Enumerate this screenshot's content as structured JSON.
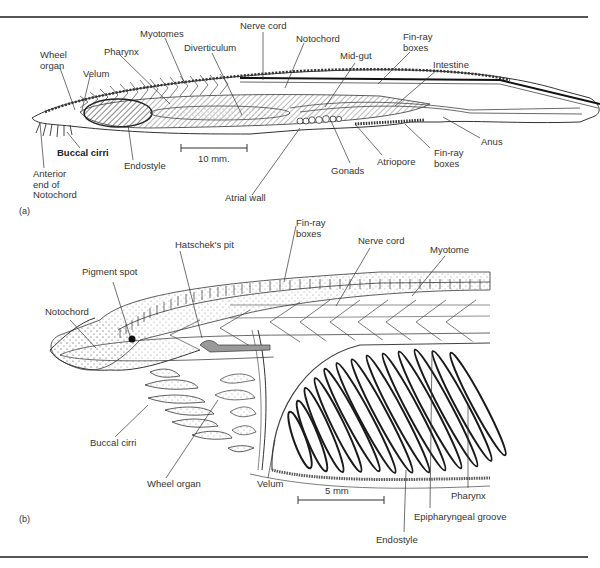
{
  "figure_a": {
    "panel_label": "(a)",
    "scale_bar": "10 mm.",
    "labels": {
      "wheel_organ": "Wheel\norgan",
      "velum": "Velum",
      "pharynx": "Pharynx",
      "myotomes": "Myotomes",
      "diverticulum": "Diverticulum",
      "nerve_cord": "Nerve cord",
      "notochord": "Notochord",
      "mid_gut": "Mid-gut",
      "fin_ray_boxes_top": "Fin-ray\nboxes",
      "intestine": "Intestine",
      "anus": "Anus",
      "fin_ray_boxes_bottom": "Fin-ray\nboxes",
      "atriopore": "Atriopore",
      "gonads": "Gonads",
      "atrial_wall": "Atrial wall",
      "endostyle": "Endostyle",
      "buccal_cirri": "Buccal cirri",
      "anterior_notochord": "Anterior\nend of\nNotochord"
    }
  },
  "figure_b": {
    "panel_label": "(b)",
    "scale_bar": "5 mm",
    "labels": {
      "hatscheks_pit": "Hatschek's pit",
      "fin_ray_boxes": "Fin-ray\nboxes",
      "nerve_cord": "Nerve cord",
      "myotome": "Myotome",
      "pigment_spot": "Pigment spot",
      "notochord": "Notochord",
      "buccal_cirri": "Buccal cirri",
      "wheel_organ": "Wheel organ",
      "velum": "Velum",
      "pharynx": "Pharynx",
      "epipharyngeal_groove": "Epipharyngeal groove",
      "endostyle": "Endostyle"
    }
  }
}
